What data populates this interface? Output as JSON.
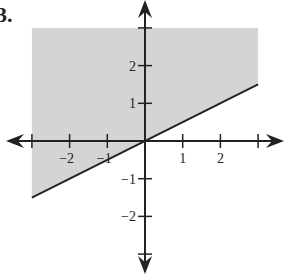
{
  "problem_label": "3.",
  "chart_data": {
    "type": "area",
    "title": "",
    "xlabel": "",
    "ylabel": "",
    "xlim": [
      -3,
      3
    ],
    "ylim": [
      -3,
      3
    ],
    "x_ticks": [
      -3,
      -2,
      -1,
      1,
      2,
      3
    ],
    "x_tick_labels": [
      "-2",
      "-1",
      "1",
      "2"
    ],
    "y_ticks": [
      -3,
      -2,
      -1,
      1,
      2,
      3
    ],
    "y_tick_labels": [
      "-2",
      "-1",
      "1",
      "2"
    ],
    "grid": false,
    "boundary_line": {
      "slope": 0.5,
      "intercept": 0,
      "style": "solid",
      "points": [
        [
          -3,
          -1.5
        ],
        [
          3,
          1.5
        ]
      ]
    },
    "shaded_region": {
      "side": "above",
      "x_range": [
        -3,
        3
      ],
      "y_max": 3,
      "color": "#d4d4d4"
    },
    "axis_color": "#222222"
  }
}
